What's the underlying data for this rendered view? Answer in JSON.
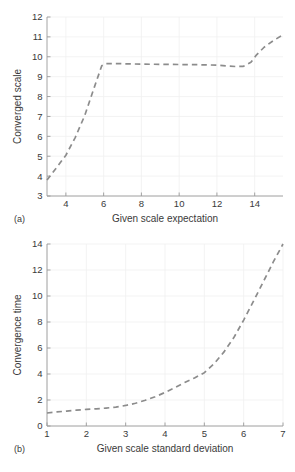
{
  "figure": {
    "panels": [
      {
        "tag": "(a)",
        "name": "converged-scale-plot",
        "chart_index": 0
      },
      {
        "tag": "(b)",
        "name": "convergence-time-plot",
        "chart_index": 1
      }
    ]
  },
  "chart_data": [
    {
      "type": "line",
      "title": "",
      "xlabel": "Given scale expectation",
      "ylabel": "Converged scale",
      "xlim": [
        3.0,
        15.5
      ],
      "ylim": [
        3,
        12
      ],
      "xticks": [
        4,
        6,
        8,
        10,
        12,
        14
      ],
      "yticks": [
        3,
        4,
        5,
        6,
        7,
        8,
        9,
        10,
        11,
        12
      ],
      "xticklabels": [
        "4",
        "6",
        "8",
        "10",
        "12",
        "14"
      ],
      "yticklabels": [
        "3",
        "4",
        "5",
        "6",
        "7",
        "8",
        "9",
        "10",
        "11",
        "12"
      ],
      "grid": true,
      "legend": null,
      "linestyle": "dashed",
      "color": "#8c8c8c",
      "x": [
        3.0,
        3.5,
        4.0,
        4.5,
        5.0,
        5.5,
        5.9,
        6.1,
        6.5,
        7.0,
        8.0,
        9.0,
        10.0,
        11.0,
        12.0,
        12.6,
        13.0,
        13.4,
        13.8,
        14.1,
        14.5,
        15.0,
        15.5
      ],
      "y": [
        3.8,
        4.42,
        5.05,
        5.95,
        7.05,
        8.45,
        9.55,
        9.66,
        9.66,
        9.65,
        9.63,
        9.62,
        9.61,
        9.6,
        9.58,
        9.53,
        9.51,
        9.52,
        9.72,
        10.1,
        10.48,
        10.82,
        11.1
      ]
    },
    {
      "type": "line",
      "title": "",
      "xlabel": "Given scale standard deviation",
      "ylabel": "Convergence time",
      "xlim": [
        1,
        7
      ],
      "ylim": [
        0,
        14
      ],
      "xticks": [
        1,
        2,
        3,
        4,
        5,
        6,
        7
      ],
      "yticks": [
        0,
        2,
        4,
        6,
        8,
        10,
        12,
        14
      ],
      "xticklabels": [
        "1",
        "2",
        "3",
        "4",
        "5",
        "6",
        "7"
      ],
      "yticklabels": [
        "0",
        "2",
        "4",
        "6",
        "8",
        "10",
        "12",
        "14"
      ],
      "grid": true,
      "legend": null,
      "linestyle": "dashed",
      "color": "#8c8c8c",
      "x": [
        1.0,
        1.25,
        1.5,
        1.75,
        2.0,
        2.25,
        2.5,
        2.75,
        3.0,
        3.25,
        3.5,
        3.75,
        4.0,
        4.25,
        4.5,
        4.75,
        5.0,
        5.25,
        5.5,
        5.75,
        6.0,
        6.25,
        6.5,
        6.75,
        7.0
      ],
      "y": [
        1.0,
        1.08,
        1.15,
        1.22,
        1.28,
        1.32,
        1.38,
        1.45,
        1.58,
        1.75,
        1.98,
        2.25,
        2.58,
        2.95,
        3.35,
        3.7,
        4.1,
        4.8,
        5.7,
        6.8,
        8.15,
        9.6,
        11.1,
        12.6,
        14.0
      ]
    }
  ]
}
